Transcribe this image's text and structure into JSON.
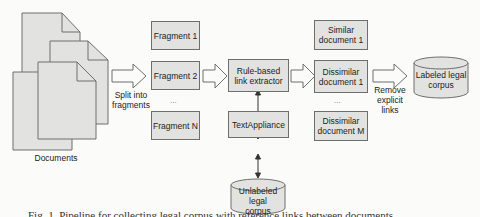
{
  "diagram": {
    "documents_label": "Documents",
    "split_label": "Split into\nfragments",
    "fragments": [
      "Fragment 1",
      "Fragment 2",
      "Fragment N"
    ],
    "fragments_ellipsis": "...",
    "extractor_label": "Rule-based\nlink extractor",
    "textappliance_label": "TextAppliance",
    "unlabeled_corpus_label": "Unlabeled legal\ncorpus",
    "similar_doc_label": "Similar\ndocument 1",
    "dissimilar_docs": [
      "Dissimilar\ndocument 1",
      "Dissimilar\ndocument M"
    ],
    "docs_ellipsis": "...",
    "remove_links_label": "Remove\nexplicit\nlinks",
    "labeled_corpus_label": "Labeled legal\ncorpus"
  },
  "caption": "Fig. 1. Pipeline for collecting legal corpus with reference links between documents"
}
